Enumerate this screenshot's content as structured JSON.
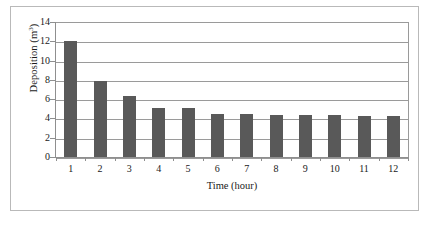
{
  "chart_data": {
    "type": "bar",
    "title": "",
    "xlabel": "Time (hour)",
    "ylabel": "Deposition (m3)",
    "ylabel_base": "Deposition (m",
    "ylabel_sup": "3",
    "ylabel_tail": ")",
    "categories": [
      "1",
      "2",
      "3",
      "4",
      "5",
      "6",
      "7",
      "8",
      "9",
      "10",
      "11",
      "12"
    ],
    "values": [
      12.15,
      7.95,
      6.4,
      5.2,
      5.2,
      4.55,
      4.55,
      4.45,
      4.45,
      4.45,
      4.4,
      4.35
    ],
    "ylim": [
      0,
      14
    ],
    "yticks": [
      "0",
      "2",
      "4",
      "6",
      "8",
      "10",
      "12",
      "14"
    ],
    "ytick_values": [
      0,
      2,
      4,
      6,
      8,
      10,
      12,
      14
    ],
    "grid": "horizontal",
    "legend": "none",
    "series_color": "#595959",
    "grid_color": "#9a9a9a",
    "axis_color": "#8f8f8f",
    "frame_color": "#b9b9b9",
    "background": "#ffffff"
  }
}
